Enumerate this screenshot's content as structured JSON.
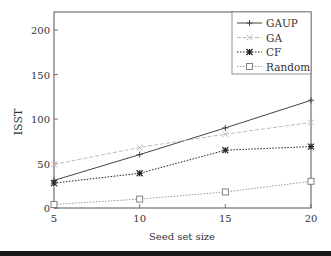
{
  "chart_data": {
    "type": "line",
    "title": "",
    "xlabel": "Seed set size",
    "ylabel": "ISST",
    "x": [
      5,
      10,
      15,
      20
    ],
    "xlim": [
      5,
      20
    ],
    "ylim": [
      0,
      220
    ],
    "xticks": [
      5,
      10,
      15,
      20
    ],
    "yticks": [
      0,
      50,
      100,
      150,
      200
    ],
    "grid": false,
    "legend_position": "upper right",
    "series": [
      {
        "name": "GAUP",
        "values": [
          31,
          60,
          90,
          121
        ],
        "marker": "plus",
        "line": "solid",
        "color": "#444444"
      },
      {
        "name": "GA",
        "values": [
          49,
          68,
          83,
          96
        ],
        "marker": "x",
        "line": "dashed",
        "color": "#bbbbbb"
      },
      {
        "name": "CF",
        "values": [
          28,
          39,
          65,
          69
        ],
        "marker": "asterisk",
        "line": "dotted",
        "color": "#222222"
      },
      {
        "name": "Random",
        "values": [
          4,
          10,
          18,
          30
        ],
        "marker": "square",
        "line": "dotted",
        "color": "#999999"
      }
    ]
  }
}
